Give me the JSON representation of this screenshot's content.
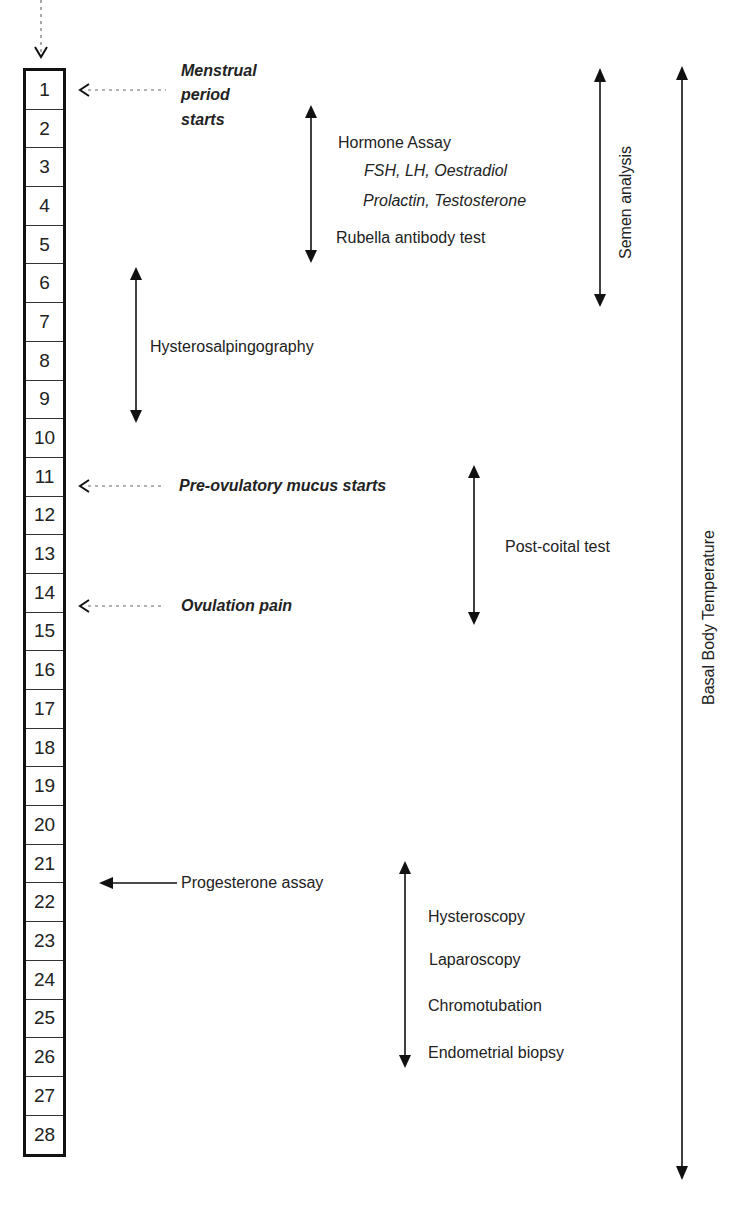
{
  "cycle": {
    "days": [
      "1",
      "2",
      "3",
      "4",
      "5",
      "6",
      "7",
      "8",
      "9",
      "10",
      "11",
      "12",
      "13",
      "14",
      "15",
      "16",
      "17",
      "18",
      "19",
      "20",
      "21",
      "22",
      "23",
      "24",
      "25",
      "26",
      "27",
      "28"
    ]
  },
  "events": {
    "menstrual": {
      "line1": "Menstrual",
      "line2": "period",
      "line3": "starts",
      "day": 1
    },
    "mucus": {
      "label": "Pre-ovulatory mucus starts",
      "day": 11
    },
    "ovulation": {
      "label": "Ovulation pain",
      "day": 14
    },
    "progesterone": {
      "label": "Progesterone assay",
      "day": 21
    }
  },
  "tests": {
    "hormone": {
      "title": "Hormone Assay",
      "line2": "FSH, LH, Oestradiol",
      "line3": "Prolactin, Testosterone",
      "line4": "Rubella antibody test",
      "days": [
        2,
        5
      ]
    },
    "hsg": {
      "label": "Hysterosalpingography",
      "days": [
        6,
        9
      ]
    },
    "postcoital": {
      "label": "Post-coital test",
      "days": [
        11,
        14
      ]
    },
    "luteal": {
      "items": [
        "Hysteroscopy",
        "Laparoscopy",
        "Chromotubation",
        "Endometrial biopsy"
      ],
      "days": [
        21,
        26
      ]
    },
    "semen": {
      "label": "Semen analysis",
      "days": [
        1,
        6
      ]
    },
    "bbt": {
      "label": "Basal Body Temperature",
      "days": [
        1,
        28
      ]
    }
  }
}
